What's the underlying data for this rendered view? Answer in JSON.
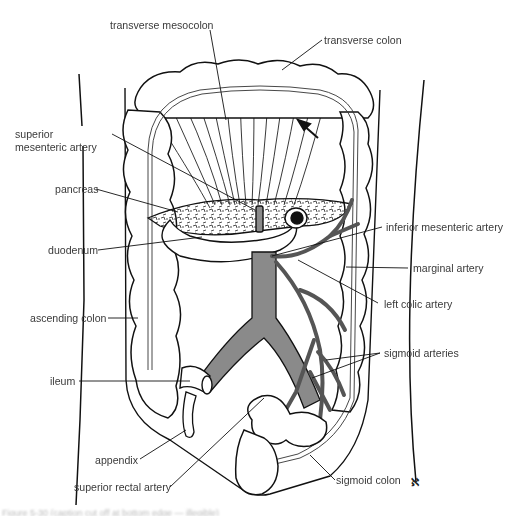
{
  "figure": {
    "colors": {
      "outline": "#111111",
      "vessel_fill": "#8a8a8a",
      "background": "#ffffff",
      "label_text": "#3a3a3a"
    },
    "labels": {
      "transverse_mesocolon": "transverse mesocolon",
      "transverse_colon": "transverse colon",
      "superior_mesenteric_artery": "superior mesenteric artery",
      "pancreas": "pancreas",
      "duodenum": "duodenum",
      "inferior_mesenteric_artery": "inferior mesenteric artery",
      "marginal_artery": "marginal artery",
      "left_colic_artery": "left colic artery",
      "ascending_colon": "ascending colon",
      "sigmoid_arteries": "sigmoid arteries",
      "ileum": "ileum",
      "appendix": "appendix",
      "superior_rectal_artery": "superior rectal artery",
      "sigmoid_colon": "sigmoid colon"
    },
    "artist_mark": "ℵ",
    "caption": "Figure 5-30  (caption cut off at bottom edge — illegible)"
  }
}
